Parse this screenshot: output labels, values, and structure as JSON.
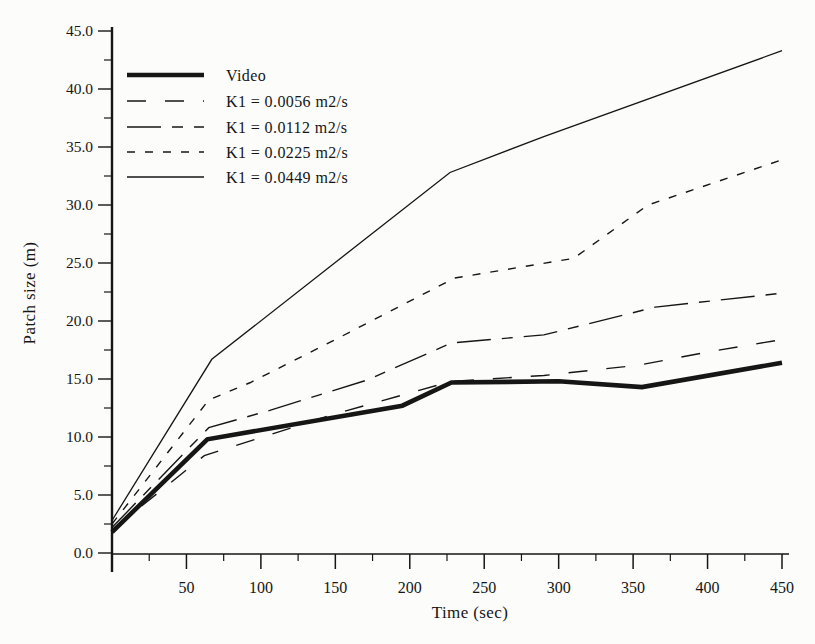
{
  "figure": {
    "background": "#fcfcfa",
    "ink": "#161616"
  },
  "chart_data": {
    "type": "line",
    "title": "",
    "xlabel": "Time (sec)",
    "ylabel": "Patch size (m)",
    "xlim": [
      0,
      450
    ],
    "ylim": [
      0,
      45
    ],
    "grid": false,
    "legend_position": "upper-left-inside",
    "x_major_ticks": [
      50,
      100,
      150,
      200,
      250,
      300,
      350,
      400,
      450
    ],
    "x_minor_ticks": [
      25,
      75,
      125,
      175,
      225,
      275,
      325,
      375,
      425
    ],
    "x_tick_labels": [
      "50",
      "100",
      "150",
      "200",
      "250",
      "300",
      "350",
      "400",
      "450"
    ],
    "y_major_ticks": [
      0,
      5,
      10,
      15,
      20,
      25,
      30,
      35,
      40,
      45
    ],
    "y_minor_ticks": [
      2.5,
      7.5,
      12.5,
      17.5,
      22.5,
      27.5,
      32.5,
      37.5,
      42.5
    ],
    "y_tick_labels": [
      "0.0",
      "5.0",
      "10.0",
      "15.0",
      "20.0",
      "25.0",
      "30.0",
      "35.0",
      "40.0",
      "45.0"
    ],
    "series": [
      {
        "name": "Video",
        "style": "solid-thick",
        "points": [
          [
            0,
            1.8
          ],
          [
            64,
            9.8
          ],
          [
            195,
            12.7
          ],
          [
            228,
            14.7
          ],
          [
            300,
            14.8
          ],
          [
            356,
            14.3
          ],
          [
            450,
            16.4
          ]
        ]
      },
      {
        "name": "K1 = 0.0056 m2/s",
        "style": "dash-sparse",
        "points": [
          [
            0,
            2.0
          ],
          [
            62,
            8.4
          ],
          [
            150,
            12.0
          ],
          [
            228,
            14.8
          ],
          [
            290,
            15.3
          ],
          [
            354,
            16.2
          ],
          [
            403,
            17.4
          ],
          [
            450,
            18.4
          ]
        ]
      },
      {
        "name": "K1 = 0.0112 m2/s",
        "style": "dash-long",
        "points": [
          [
            0,
            2.2
          ],
          [
            65,
            10.8
          ],
          [
            106,
            12.3
          ],
          [
            171,
            14.9
          ],
          [
            228,
            18.1
          ],
          [
            290,
            18.8
          ],
          [
            365,
            21.2
          ],
          [
            450,
            22.4
          ]
        ]
      },
      {
        "name": "K1 = 0.0225 m2/s",
        "style": "dash-short",
        "points": [
          [
            0,
            2.5
          ],
          [
            65,
            13.2
          ],
          [
            93,
            14.7
          ],
          [
            150,
            18.4
          ],
          [
            230,
            23.7
          ],
          [
            310,
            25.4
          ],
          [
            360,
            30.0
          ],
          [
            450,
            33.9
          ]
        ]
      },
      {
        "name": "K1 = 0.0449 m2/s",
        "style": "solid-thin",
        "points": [
          [
            0,
            2.8
          ],
          [
            67,
            16.7
          ],
          [
            227,
            32.8
          ],
          [
            290,
            35.9
          ],
          [
            450,
            43.3
          ]
        ]
      }
    ]
  }
}
